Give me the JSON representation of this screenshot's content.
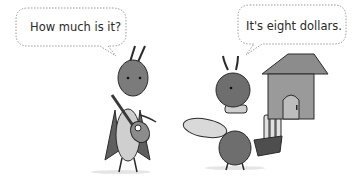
{
  "scene": {
    "left_character": {
      "type": "grasshopper",
      "holding": "guitar",
      "speech": "How much is it?"
    },
    "right_character": {
      "type": "ant",
      "holding": [
        "bread loaf",
        "basket of bread"
      ],
      "speech": "It's eight dollars."
    },
    "background": {
      "object": "small house with door"
    }
  },
  "colors": {
    "background": "#ffffff",
    "outline": "#2a2a2a",
    "body_dark": "#6e6e6e",
    "body_mid": "#8c8c8c",
    "body_light": "#c9c9c9",
    "bubble_border": "#9a9a9a"
  }
}
